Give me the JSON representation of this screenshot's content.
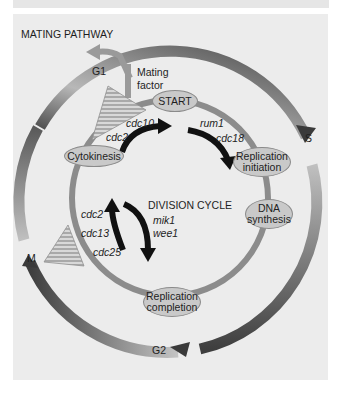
{
  "diagram": {
    "title": "MATING PATHWAY",
    "center_label": "DIVISION CYCLE",
    "mating_factor": [
      "Mating",
      "factor"
    ],
    "phases": {
      "g1": "G1",
      "s": "S",
      "g2": "G2",
      "m": "M"
    },
    "events": {
      "start": "START",
      "cytokinesis": "Cytokinesis",
      "replication_initiation": [
        "Replication",
        "initiation"
      ],
      "dna_synthesis": [
        "DNA",
        "synthesis"
      ],
      "replication_completion": [
        "Replication",
        "completion"
      ]
    },
    "genes": {
      "cdc10": "cdc10",
      "cdc2_top": "cdc2",
      "rum1": "rum1",
      "cdc18": "cdc18",
      "cdc2_bottom": "cdc2",
      "cdc13": "cdc13",
      "cdc25": "cdc25",
      "mik1": "mik1",
      "wee1": "wee1"
    },
    "colors": {
      "background": "#ececec",
      "outer_ring_light": "#b4b4b4",
      "outer_ring_dark": "#4a4a4a",
      "inner_ring": "#8c8c8c",
      "node_fill": "#c9c9c9",
      "arrow": "#111111"
    }
  }
}
